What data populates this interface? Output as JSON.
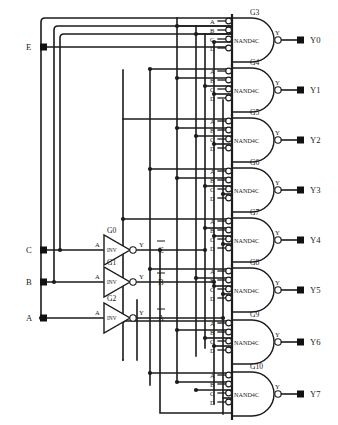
{
  "diagram": {
    "type": "logic-schematic",
    "line_color": "#1b1b1b",
    "background_color": "#ffffff"
  },
  "inputs": [
    {
      "name": "E",
      "label": "E",
      "x": 42,
      "y": 47
    },
    {
      "name": "C",
      "label": "C",
      "x": 42,
      "y": 250
    },
    {
      "name": "B",
      "label": "B",
      "x": 42,
      "y": 282
    },
    {
      "name": "A",
      "label": "A",
      "x": 42,
      "y": 318
    }
  ],
  "outputs": [
    {
      "name": "Y0",
      "label": "Y0",
      "y": 40
    },
    {
      "name": "Y1",
      "label": "Y1",
      "y": 90
    },
    {
      "name": "Y2",
      "label": "Y2",
      "y": 140
    },
    {
      "name": "Y3",
      "label": "Y3",
      "y": 190
    },
    {
      "name": "Y4",
      "label": "Y4",
      "y": 240
    },
    {
      "name": "Y5",
      "label": "Y5",
      "y": 290
    },
    {
      "name": "Y6",
      "label": "Y6",
      "y": 342
    },
    {
      "name": "Y7",
      "label": "Y7",
      "y": 394
    }
  ],
  "inverters": [
    {
      "ref": "G0",
      "type": "INV",
      "in_pin": "A",
      "out_pin": "Y",
      "out_label": "C",
      "out_overbar": true,
      "y": 250
    },
    {
      "ref": "G1",
      "type": "INV",
      "in_pin": "A",
      "out_pin": "Y",
      "out_label": "B",
      "out_overbar": true,
      "y": 282
    },
    {
      "ref": "G2",
      "type": "INV",
      "in_pin": "A",
      "out_pin": "Y",
      "out_label": "A",
      "out_overbar": true,
      "y": 318
    }
  ],
  "nand_gates": [
    {
      "ref": "G3",
      "type": "NAND4C",
      "pins": [
        "A",
        "B",
        "C",
        "D"
      ],
      "out_pin": "Y",
      "output": "Y0",
      "y": 40
    },
    {
      "ref": "G4",
      "type": "NAND4C",
      "pins": [
        "A",
        "B",
        "C",
        "D"
      ],
      "out_pin": "Y",
      "output": "Y1",
      "y": 90
    },
    {
      "ref": "G5",
      "type": "NAND4C",
      "pins": [
        "A",
        "B",
        "C",
        "D"
      ],
      "out_pin": "Y",
      "output": "Y2",
      "y": 140
    },
    {
      "ref": "G6",
      "type": "NAND4C",
      "pins": [
        "A",
        "B",
        "C",
        "D"
      ],
      "out_pin": "Y",
      "output": "Y3",
      "y": 190
    },
    {
      "ref": "G7",
      "type": "NAND4C",
      "pins": [
        "A",
        "B",
        "C",
        "D"
      ],
      "out_pin": "Y",
      "output": "Y4",
      "y": 240
    },
    {
      "ref": "G8",
      "type": "NAND4C",
      "pins": [
        "A",
        "B",
        "C",
        "D"
      ],
      "out_pin": "Y",
      "output": "Y5",
      "y": 290
    },
    {
      "ref": "G9",
      "type": "NAND4C",
      "pins": [
        "A",
        "B",
        "C",
        "D"
      ],
      "out_pin": "Y",
      "output": "Y6",
      "y": 342
    },
    {
      "ref": "G10",
      "type": "NAND4C",
      "pins": [
        "A",
        "B",
        "C",
        "D"
      ],
      "out_pin": "Y",
      "output": "Y7",
      "y": 394
    }
  ],
  "pin_labels": {
    "a": "A",
    "b": "B",
    "c": "C",
    "d": "D",
    "y": "Y"
  },
  "gate_text": {
    "nand": "NAND4C",
    "inv": "INV"
  }
}
